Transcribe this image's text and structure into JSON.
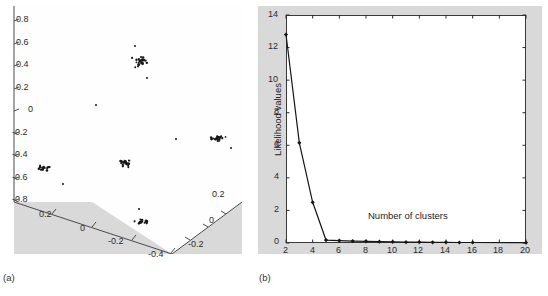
{
  "figure": {
    "panels": [
      {
        "caption": "(a)"
      },
      {
        "caption": "(b)"
      }
    ]
  },
  "chart_data": [
    {
      "type": "scatter",
      "panel": "(a)",
      "title": "",
      "projection": "3d",
      "xlabel": "",
      "ylabel": "",
      "zlabel": "",
      "x_ticks": [
        "0.2",
        "0",
        "-0.2",
        "-0.4"
      ],
      "y_ticks": [
        "0.2",
        "0",
        "-0.2"
      ],
      "z_ticks": [
        "0.8",
        "0.6",
        "0.4",
        "0.2",
        "0",
        "-0.2",
        "-0.4",
        "-0.6",
        "-0.8"
      ],
      "grid": false,
      "legend": "none",
      "marker": "dot",
      "marker_color": "#1a1a1a",
      "clusters": [
        {
          "name": "cluster-1",
          "center_px": [
            139,
            55
          ],
          "n": 26,
          "spread_px": [
            9,
            7
          ]
        },
        {
          "name": "cluster-2",
          "center_px": [
            125,
            157
          ],
          "n": 24,
          "spread_px": [
            9,
            5
          ]
        },
        {
          "name": "cluster-3",
          "center_px": [
            216,
            132
          ],
          "n": 22,
          "spread_px": [
            10,
            4
          ]
        },
        {
          "name": "cluster-4",
          "center_px": [
            45,
            162
          ],
          "n": 16,
          "spread_px": [
            7,
            4
          ]
        },
        {
          "name": "cluster-5",
          "center_px": [
            142,
            216
          ],
          "n": 17,
          "spread_px": [
            8,
            3
          ]
        }
      ],
      "outliers_px": [
        [
          63,
          178
        ],
        [
          139,
          203
        ],
        [
          176,
          133
        ],
        [
          231,
          142
        ],
        [
          96,
          99
        ],
        [
          135,
          40
        ],
        [
          147,
          72
        ]
      ]
    },
    {
      "type": "line",
      "panel": "(b)",
      "title": "",
      "xlabel": "Number of clusters",
      "ylabel": "Likelihood values",
      "x": [
        2,
        3,
        4,
        5,
        6,
        7,
        8,
        9,
        10,
        11,
        12,
        13,
        14,
        15,
        16,
        20
      ],
      "values": [
        12.8,
        6.15,
        2.5,
        0.18,
        0.15,
        0.12,
        0.1,
        0.08,
        0.07,
        0.05,
        0.05,
        0.04,
        0.04,
        0.03,
        0.03,
        0.02
      ],
      "series": [
        {
          "name": "Likelihood values",
          "values": [
            12.8,
            6.15,
            2.5,
            0.18,
            0.15,
            0.12,
            0.1,
            0.08,
            0.07,
            0.05,
            0.05,
            0.04,
            0.04,
            0.03,
            0.03,
            0.02
          ]
        }
      ],
      "xlim": [
        2,
        20
      ],
      "ylim": [
        0,
        14
      ],
      "x_ticks": [
        "2",
        "4",
        "6",
        "8",
        "10",
        "12",
        "14",
        "16",
        "18",
        "20"
      ],
      "y_ticks": [
        "0",
        "2",
        "4",
        "6",
        "8",
        "10",
        "12",
        "14"
      ],
      "grid": false,
      "legend": "none",
      "line_color": "#1a1a1a",
      "marker": "diamond"
    }
  ],
  "panel_a": {
    "z_ticks": [
      {
        "label": "0.8",
        "x": 16,
        "y": 12
      },
      {
        "label": "0.6",
        "x": 16,
        "y": 35
      },
      {
        "label": "0.4",
        "x": 16,
        "y": 57
      },
      {
        "label": "0.2",
        "x": 16,
        "y": 80
      },
      {
        "label": "0",
        "x": 27,
        "y": 102
      },
      {
        "label": "-0.2",
        "x": 11,
        "y": 125
      },
      {
        "label": "-0.4",
        "x": 11,
        "y": 147
      },
      {
        "label": "-0.6",
        "x": 11,
        "y": 170
      },
      {
        "label": "-0.8",
        "x": 11,
        "y": 192
      }
    ],
    "x_ticks": [
      {
        "label": "0.2",
        "x": 41,
        "y": 207
      },
      {
        "label": "0",
        "x": 76,
        "y": 222
      },
      {
        "label": "-0.2",
        "x": 100,
        "y": 236
      },
      {
        "label": "-0.4",
        "x": 144,
        "y": 250
      }
    ],
    "y_ticks": [
      {
        "label": "0.2",
        "x": 205,
        "y": 187
      },
      {
        "label": "0",
        "x": 200,
        "y": 213
      },
      {
        "label": "-0.2",
        "x": 183,
        "y": 237
      }
    ]
  },
  "panel_b": {
    "ylabel": "Likelihood values",
    "inner_label": "Number of clusters",
    "y_ticks": [
      {
        "label": "14",
        "y": 9
      },
      {
        "label": "12",
        "y": 41
      },
      {
        "label": "10",
        "y": 74
      },
      {
        "label": "8",
        "y": 106
      },
      {
        "label": "6",
        "y": 139
      },
      {
        "label": "4",
        "y": 171
      },
      {
        "label": "2",
        "y": 204
      },
      {
        "label": "0",
        "y": 236
      }
    ],
    "x_ticks": [
      {
        "label": "2",
        "x": 28
      },
      {
        "label": "4",
        "x": 55
      },
      {
        "label": "6",
        "x": 81
      },
      {
        "label": "8",
        "x": 108
      },
      {
        "label": "10",
        "x": 135
      },
      {
        "label": "12",
        "x": 161
      },
      {
        "label": "14",
        "x": 188
      },
      {
        "label": "16",
        "x": 215
      },
      {
        "label": "18",
        "x": 241
      },
      {
        "label": "20",
        "x": 268
      }
    ]
  }
}
